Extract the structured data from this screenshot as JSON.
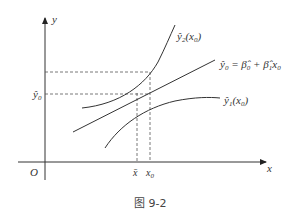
{
  "diagram": {
    "axes": {
      "x_label": "x",
      "y_label": "y",
      "origin_label": "O"
    },
    "x_ticks": {
      "x_bar": "x̄",
      "x0": "x",
      "x0_sub": "0"
    },
    "y_ticks": {
      "y0_hat": "ŷ",
      "y0_sub": "0"
    },
    "curves": {
      "upper": {
        "name": "ŷ",
        "sub": "2",
        "arg": "(x",
        "arg_sub": "0",
        "close": ")"
      },
      "regression_line": {
        "lhs": "ŷ",
        "lhs_sub": "0",
        "eq": " = ",
        "b0": "β̂",
        "b0_sub": "0",
        "plus": " + ",
        "b1": "β̂",
        "b1_sub": "1",
        "x": "x",
        "x_sub": "0"
      },
      "lower": {
        "name": "ŷ",
        "sub": "1",
        "arg": "(x",
        "arg_sub": "0",
        "close": ")"
      }
    },
    "caption": "图 9-2"
  }
}
